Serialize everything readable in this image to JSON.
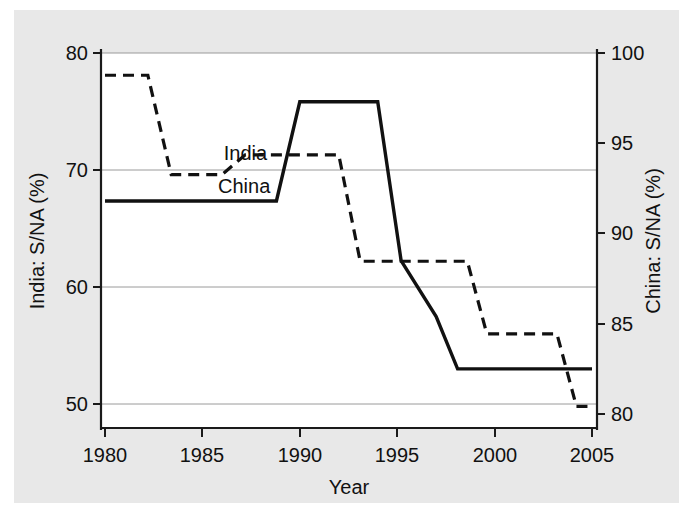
{
  "figure": {
    "background_color": "#e8e8e8",
    "plot_background_color": "#ffffff",
    "ink_color": "#111111",
    "gridline_color": "#9a9a9a"
  },
  "chart_data": {
    "type": "line",
    "title": "",
    "subtitle": "",
    "xlabel": "Year",
    "ylabel": "India: S/NA (%)",
    "y2label": "China: S/NA (%)",
    "xlim": [
      1980,
      2005
    ],
    "ylim": [
      48.5,
      80.6
    ],
    "y2lim": [
      79.1,
      100.4
    ],
    "grid": true,
    "legend_position": "inline-annotation",
    "xticks": [
      1980,
      1985,
      1990,
      1995,
      2000,
      2005
    ],
    "xticklabels": [
      "1980",
      "1985",
      "1990",
      "1995",
      "2000",
      "2005"
    ],
    "yticks": [
      50,
      60,
      70,
      80
    ],
    "yticklabels": [
      "50",
      "60",
      "70",
      "80"
    ],
    "y2ticks": [
      80,
      85,
      90,
      95,
      100
    ],
    "y2ticklabels": [
      "80",
      "85",
      "90",
      "95",
      "100"
    ],
    "series": [
      {
        "name": "India",
        "axis": "left",
        "style": "dashed",
        "label_text": "India",
        "label_x": 1986.1,
        "label_y": 70.9,
        "x": [
          1980,
          1982.2,
          1983.4,
          1986.0,
          1987.2,
          1992.0,
          1993.1,
          1998.6,
          1999.6,
          2003.2,
          2004.2,
          2005
        ],
        "y": [
          78.1,
          78.1,
          69.6,
          69.6,
          71.3,
          71.3,
          62.2,
          62.2,
          56.0,
          56.0,
          49.8,
          49.8
        ]
      },
      {
        "name": "China",
        "axis": "right",
        "style": "solid",
        "label_text": "China",
        "label_x": 1985.8,
        "label_y": 68.0,
        "x": [
          1980,
          1988.8,
          1990.0,
          1994.0,
          1995.2,
          1997.0,
          1998.1,
          2005
        ],
        "y_left_equivalent": [
          66.5,
          66.5,
          74.8,
          74.8,
          61.6,
          56.8,
          52.4,
          52.4
        ],
        "y": [
          91.8,
          91.8,
          97.3,
          97.3,
          88.5,
          85.4,
          82.5,
          82.5
        ]
      }
    ],
    "annotations": [
      {
        "text": "India",
        "describes": "dashed-series"
      },
      {
        "text": "China",
        "describes": "solid-series"
      }
    ]
  }
}
